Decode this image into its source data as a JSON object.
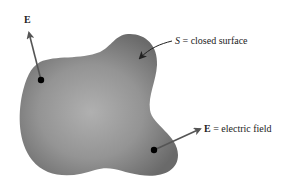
{
  "diagram": {
    "vector_label_top": "E",
    "surface_label": {
      "symbol": "S",
      "rest": " = closed surface"
    },
    "field_label": {
      "symbol": "E",
      "rest": " = electric field"
    }
  },
  "colors": {
    "surface_fill_dark": "#6e6e6e",
    "surface_fill_light": "#a8a8a8",
    "arrow": "#555555",
    "point": "#000000",
    "text": "#222222"
  }
}
